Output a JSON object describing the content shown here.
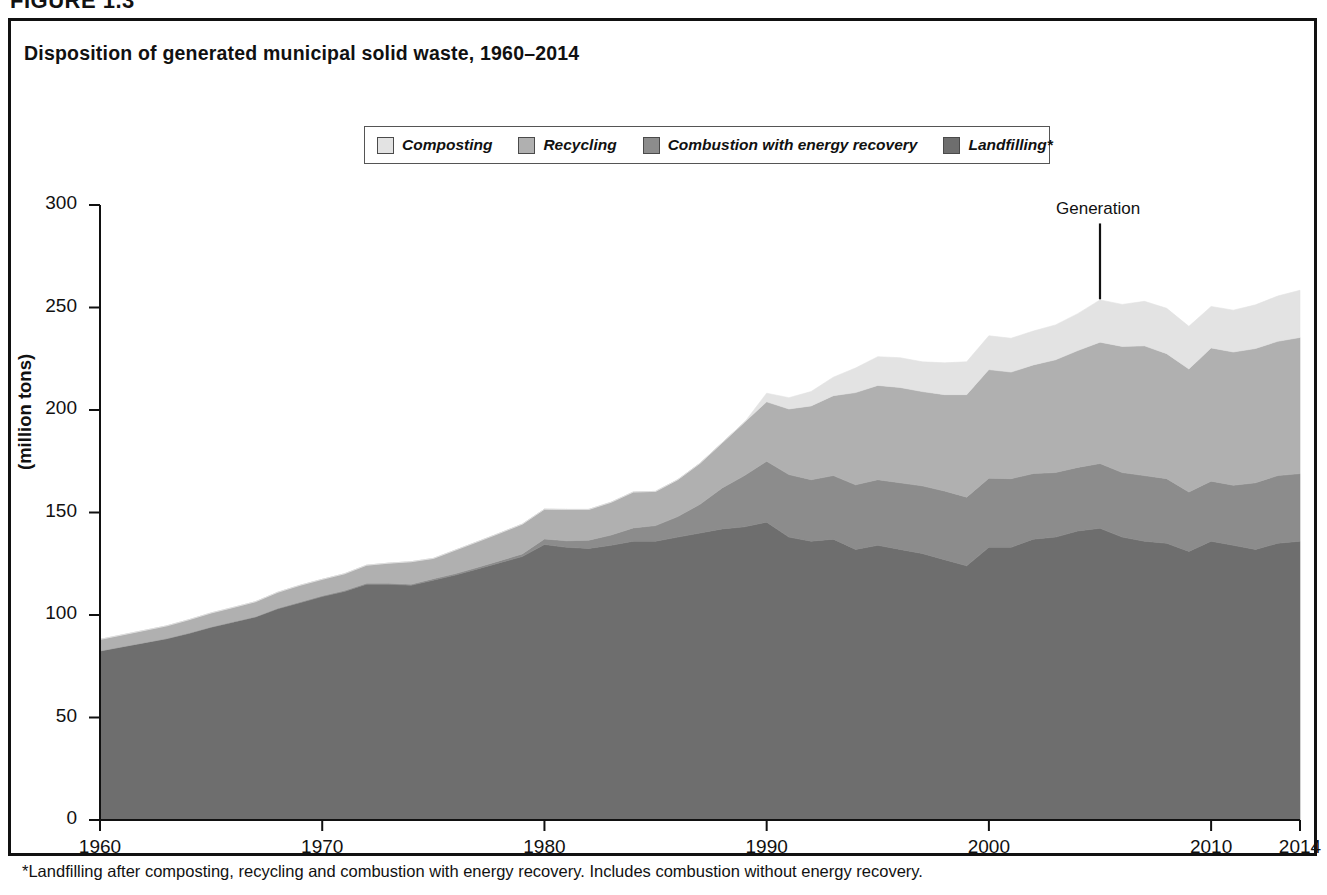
{
  "figure": {
    "label": "FIGURE 1.3",
    "title": "Disposition of generated municipal solid waste, 1960–2014",
    "footnote": "*Landfilling after composting, recycling and combustion with energy recovery. Includes combustion without energy recovery.",
    "annotation": "Generation"
  },
  "legend": {
    "position": "top-center",
    "items": [
      {
        "label": "Composting",
        "color": "#e3e3e3",
        "swatch_name": "legend-swatch-composting"
      },
      {
        "label": "Recycling",
        "color": "#b0b0b0",
        "swatch_name": "legend-swatch-recycling"
      },
      {
        "label": "Combustion with energy recovery",
        "color": "#8c8c8c",
        "swatch_name": "legend-swatch-combustion"
      },
      {
        "label": "Landfilling*",
        "color": "#6e6e6e",
        "swatch_name": "legend-swatch-landfilling"
      }
    ]
  },
  "axes": {
    "y": {
      "title": "(million tons)",
      "min": 0,
      "max": 300,
      "step": 50,
      "ticks": [
        "0",
        "50",
        "100",
        "150",
        "200",
        "250",
        "300"
      ]
    },
    "x": {
      "min": 1960,
      "max": 2014,
      "ticks": [
        "1960",
        "1970",
        "1980",
        "1990",
        "2000",
        "2010",
        "2014"
      ],
      "tick_values": [
        1960,
        1970,
        1980,
        1990,
        2000,
        2010,
        2014
      ]
    }
  },
  "chart_data": {
    "type": "area",
    "title": "Disposition of generated municipal solid waste, 1960–2014",
    "xlabel": "",
    "ylabel": "(million tons)",
    "ylim": [
      0,
      300
    ],
    "xlim": [
      1960,
      2014
    ],
    "grid": false,
    "legend_position": "top-center",
    "stacked": true,
    "stack_order_bottom_to_top": [
      "Landfilling*",
      "Combustion with energy recovery",
      "Recycling",
      "Composting"
    ],
    "annotations": [
      {
        "text": "Generation",
        "x": 2005,
        "y": 254,
        "note": "leader line to top of stack (total generation)"
      }
    ],
    "x": [
      1960,
      1961,
      1962,
      1963,
      1964,
      1965,
      1966,
      1967,
      1968,
      1969,
      1970,
      1971,
      1972,
      1973,
      1974,
      1975,
      1976,
      1977,
      1978,
      1979,
      1980,
      1981,
      1982,
      1983,
      1984,
      1985,
      1986,
      1987,
      1988,
      1989,
      1990,
      1991,
      1992,
      1993,
      1994,
      1995,
      1996,
      1997,
      1998,
      1999,
      2000,
      2001,
      2002,
      2003,
      2004,
      2005,
      2006,
      2007,
      2008,
      2009,
      2010,
      2011,
      2012,
      2013,
      2014
    ],
    "series": [
      {
        "name": "Landfilling*",
        "color": "#6e6e6e",
        "values": [
          82.5,
          84.5,
          86.5,
          88.5,
          91.0,
          94.0,
          96.5,
          99.0,
          103.0,
          106.0,
          109.0,
          111.5,
          115.0,
          115.0,
          114.5,
          117.0,
          119.5,
          122.5,
          125.5,
          128.5,
          134.4,
          133.0,
          132.5,
          134.0,
          136.0,
          136.0,
          138.0,
          140.0,
          142.0,
          143.0,
          145.3,
          138.0,
          136.0,
          137.0,
          132.0,
          134.0,
          132.0,
          130.0,
          127.0,
          124.0,
          133.0,
          133.0,
          137.0,
          138.0,
          141.0,
          142.3,
          138.0,
          136.0,
          135.0,
          131.0,
          136.0,
          134.0,
          132.0,
          135.0,
          136.0
        ]
      },
      {
        "name": "Combustion with energy recovery",
        "color": "#8c8c8c",
        "values": [
          0.0,
          0.0,
          0.0,
          0.0,
          0.2,
          0.2,
          0.2,
          0.2,
          0.3,
          0.3,
          0.4,
          0.4,
          0.5,
          0.5,
          0.5,
          0.7,
          0.7,
          0.8,
          1.0,
          1.3,
          2.7,
          3.2,
          4.0,
          5.0,
          6.5,
          7.6,
          10.0,
          14.0,
          20.0,
          25.0,
          29.7,
          30.5,
          30.0,
          31.0,
          31.5,
          32.0,
          32.5,
          33.0,
          33.5,
          33.5,
          33.7,
          33.5,
          32.0,
          31.5,
          31.0,
          31.6,
          31.5,
          32.0,
          31.5,
          29.0,
          29.3,
          29.3,
          32.5,
          33.0,
          33.0
        ]
      },
      {
        "name": "Recycling",
        "color": "#b0b0b0",
        "values": [
          5.6,
          5.8,
          6.0,
          6.2,
          6.5,
          6.8,
          7.0,
          7.3,
          7.8,
          8.2,
          8.0,
          8.2,
          8.8,
          9.8,
          11.0,
          9.9,
          11.5,
          12.5,
          13.5,
          14.5,
          14.5,
          15.3,
          15.0,
          16.0,
          17.5,
          16.7,
          18.0,
          20.0,
          22.0,
          26.0,
          29.0,
          32.0,
          36.0,
          39.0,
          45.0,
          46.0,
          46.5,
          46.0,
          47.0,
          50.0,
          53.0,
          52.0,
          53.0,
          55.0,
          57.0,
          59.2,
          61.5,
          63.3,
          61.0,
          60.0,
          65.0,
          65.0,
          65.5,
          65.5,
          66.4
        ]
      },
      {
        "name": "Composting",
        "color": "#e3e3e3",
        "values": [
          0.0,
          0.0,
          0.0,
          0.0,
          0.0,
          0.0,
          0.0,
          0.0,
          0.0,
          0.0,
          0.0,
          0.0,
          0.0,
          0.0,
          0.0,
          0.0,
          0.0,
          0.0,
          0.0,
          0.0,
          0.0,
          0.0,
          0.0,
          0.0,
          0.0,
          0.0,
          0.0,
          0.0,
          0.0,
          0.0,
          4.2,
          5.5,
          7.0,
          9.0,
          12.0,
          14.0,
          14.5,
          14.5,
          15.5,
          16.0,
          16.5,
          16.5,
          16.5,
          17.0,
          18.0,
          20.6,
          20.5,
          21.7,
          22.1,
          20.8,
          20.2,
          20.4,
          21.3,
          22.1,
          23.0
        ]
      }
    ],
    "total_generation": [
      88.1,
      90.3,
      92.5,
      94.7,
      97.7,
      101.0,
      103.7,
      106.5,
      111.1,
      114.5,
      117.4,
      120.1,
      124.3,
      125.3,
      126.0,
      127.6,
      131.7,
      135.8,
      140.0,
      144.3,
      151.6,
      151.5,
      151.5,
      155.0,
      160.0,
      160.3,
      166.0,
      174.0,
      184.0,
      194.0,
      208.2,
      206.0,
      209.0,
      216.0,
      220.5,
      226.0,
      225.5,
      223.5,
      223.0,
      223.5,
      236.2,
      235.0,
      238.5,
      241.5,
      247.0,
      253.7,
      251.5,
      253.0,
      249.6,
      240.8,
      250.5,
      248.7,
      251.3,
      255.6,
      258.4
    ]
  }
}
